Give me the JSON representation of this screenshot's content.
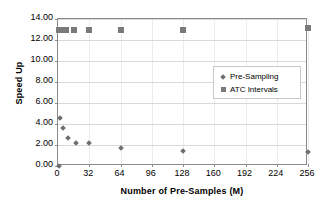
{
  "chart_data": {
    "type": "scatter",
    "title": "",
    "xlabel": "Number of Pre-Samples (M)",
    "ylabel": "Speed Up",
    "xlim": [
      0,
      256
    ],
    "ylim": [
      0,
      14
    ],
    "grid": true,
    "legend_position": "inside-top-right",
    "xticks": [
      "0",
      "32",
      "64",
      "96",
      "128",
      "160",
      "192",
      "224",
      "256"
    ],
    "xtick_values": [
      0,
      32,
      64,
      96,
      128,
      160,
      192,
      224,
      256
    ],
    "yticks": [
      "0.00",
      "2.00",
      "4.00",
      "6.00",
      "8.00",
      "10.00",
      "12.00",
      "14.00"
    ],
    "ytick_values": [
      0,
      2,
      4,
      6,
      8,
      10,
      12,
      14
    ],
    "series": [
      {
        "name": "Pre-Sampling",
        "marker": "diamond",
        "color": "#6e6e6e",
        "points": [
          {
            "x": 1,
            "y": 0.0
          },
          {
            "x": 2,
            "y": 4.6
          },
          {
            "x": 5,
            "y": 3.6
          },
          {
            "x": 10,
            "y": 2.65
          },
          {
            "x": 18,
            "y": 2.15
          },
          {
            "x": 32,
            "y": 2.15
          },
          {
            "x": 64,
            "y": 1.7
          },
          {
            "x": 128,
            "y": 1.45
          },
          {
            "x": 256,
            "y": 1.3
          }
        ]
      },
      {
        "name": "ATC Intervals",
        "marker": "square",
        "color": "#7a7a7a",
        "points": [
          {
            "x": 1,
            "y": 13.0
          },
          {
            "x": 2,
            "y": 13.0
          },
          {
            "x": 4,
            "y": 13.0
          },
          {
            "x": 8,
            "y": 13.0
          },
          {
            "x": 16,
            "y": 13.0
          },
          {
            "x": 32,
            "y": 13.0
          },
          {
            "x": 64,
            "y": 13.0
          },
          {
            "x": 128,
            "y": 13.0
          },
          {
            "x": 256,
            "y": 13.1
          }
        ]
      }
    ],
    "legend": [
      {
        "label": "Pre-Sampling",
        "marker": "diamond"
      },
      {
        "label": "ATC Intervals",
        "marker": "square"
      }
    ]
  }
}
